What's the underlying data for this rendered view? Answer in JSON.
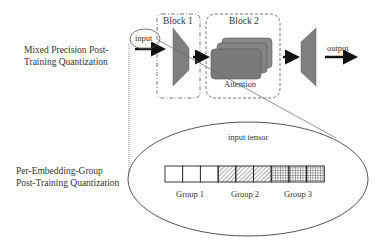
{
  "labels": {
    "mixed_precision": "Mixed Precision Post-\nTraining Quantization",
    "per_embedding": "Per-Embedding-Group\nPost-Training Quantization"
  },
  "top_diagram": {
    "input_label": "input",
    "block1_label": "Block 1",
    "block2_label": "Block 2",
    "attention_label": "Attention",
    "output_label": "output"
  },
  "zoom_detail": {
    "title": "input tensor",
    "groups": [
      {
        "label": "Group 1",
        "pattern": "empty"
      },
      {
        "label": "Group 2",
        "pattern": "diagonal-hatch"
      },
      {
        "label": "Group 3",
        "pattern": "crosshatch"
      }
    ],
    "cells_per_group": 3
  },
  "colors": {
    "trapezoid_fill": "#7f7f7f",
    "attention_fill": "#7a7a7a",
    "line": "#333333"
  }
}
